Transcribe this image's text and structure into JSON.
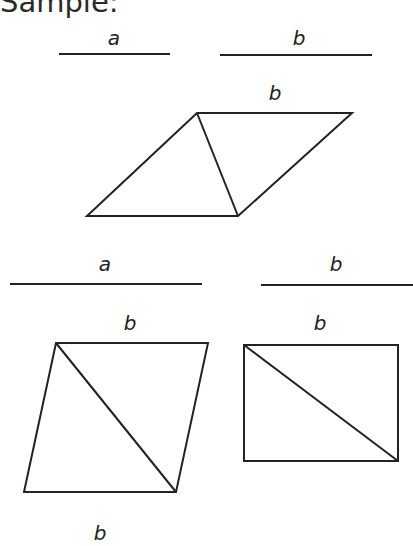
{
  "title": "Sample:",
  "segments_row1": [
    {
      "label": "a",
      "x1": 59,
      "x2": 170,
      "y": 54
    },
    {
      "label": "b",
      "x1": 220,
      "x2": 372,
      "y": 55
    }
  ],
  "figure_top": {
    "label": "b",
    "shape": "parallelogram",
    "vertices": [
      [
        197,
        113
      ],
      [
        352,
        113
      ],
      [
        238,
        216
      ],
      [
        87,
        216
      ]
    ],
    "diagonal": [
      [
        197,
        113
      ],
      [
        238,
        216
      ]
    ]
  },
  "segments_row2": [
    {
      "label": "a",
      "x1": 10,
      "x2": 202,
      "y": 284
    },
    {
      "label": "b",
      "x1": 261,
      "x2": 413,
      "y": 285
    }
  ],
  "figure_left": {
    "label": "b",
    "shape": "parallelogram",
    "vertices": [
      [
        56,
        343
      ],
      [
        208,
        343
      ],
      [
        176,
        492
      ],
      [
        24,
        492
      ]
    ],
    "diagonal": [
      [
        56,
        343
      ],
      [
        176,
        492
      ]
    ]
  },
  "figure_right": {
    "label": "b",
    "shape": "rectangle",
    "vertices": [
      [
        244,
        345
      ],
      [
        398,
        345
      ],
      [
        398,
        461
      ],
      [
        244,
        461
      ]
    ],
    "diagonal": [
      [
        244,
        345
      ],
      [
        398,
        461
      ]
    ]
  },
  "bottom_label": "b",
  "colors": {
    "stroke": "#222222",
    "background": "#ffffff"
  }
}
